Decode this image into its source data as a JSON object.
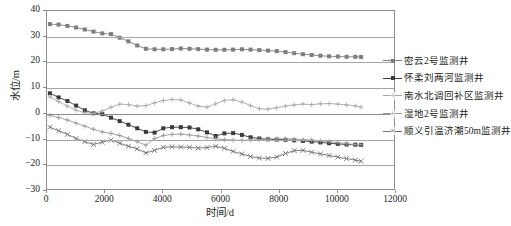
{
  "chart_data": {
    "type": "line",
    "title": "",
    "xlabel": "时间/d",
    "ylabel": "水位/m",
    "xlim": [
      0,
      12000
    ],
    "ylim": [
      -30,
      40
    ],
    "xticks": [
      0,
      2000,
      4000,
      6000,
      8000,
      10000,
      12000
    ],
    "yticks": [
      -30,
      -20,
      -10,
      0,
      10,
      20,
      30,
      40
    ],
    "grid": true,
    "legend_position": "right",
    "series": [
      {
        "name": "密云2号监测井",
        "color": "#7d7d7d",
        "marker": "square",
        "x": [
          100,
          400,
          700,
          1000,
          1300,
          1600,
          1900,
          2200,
          2500,
          2800,
          3100,
          3400,
          3700,
          4000,
          4300,
          4600,
          4900,
          5200,
          5500,
          5800,
          6100,
          6400,
          6700,
          7000,
          7300,
          7600,
          7900,
          8200,
          8500,
          8800,
          9100,
          9400,
          9700,
          10000,
          10300,
          10600,
          10800
        ],
        "y": [
          34.9,
          34.7,
          34.2,
          33.6,
          32.8,
          32.0,
          31.3,
          31.0,
          29.6,
          28.2,
          26.6,
          25.3,
          25.1,
          25.1,
          25.2,
          25.4,
          25.3,
          25.2,
          25.0,
          24.9,
          24.9,
          25.0,
          25.1,
          25.0,
          24.8,
          24.6,
          24.4,
          24.0,
          23.6,
          23.2,
          22.9,
          22.6,
          22.4,
          22.3,
          22.2,
          22.2,
          22.1
        ]
      },
      {
        "name": "怀柔刘两河监测井",
        "color": "#3a3a3a",
        "marker": "square",
        "x": [
          100,
          400,
          700,
          1000,
          1300,
          1600,
          1900,
          2200,
          2500,
          2800,
          3100,
          3400,
          3700,
          4000,
          4300,
          4600,
          4900,
          5200,
          5500,
          5800,
          6100,
          6400,
          6700,
          7000,
          7300,
          7600,
          7900,
          8200,
          8500,
          8800,
          9100,
          9400,
          9700,
          10000,
          10300,
          10600,
          10800
        ],
        "y": [
          8.0,
          6.4,
          5.0,
          3.2,
          1.4,
          0.2,
          -0.1,
          -1.5,
          -2.8,
          -4.2,
          -5.6,
          -7.0,
          -7.3,
          -5.6,
          -5.2,
          -5.2,
          -5.3,
          -6.0,
          -7.2,
          -8.6,
          -7.6,
          -7.5,
          -8.2,
          -9.1,
          -9.6,
          -9.9,
          -10.0,
          -10.1,
          -10.3,
          -10.5,
          -10.8,
          -11.1,
          -11.4,
          -11.7,
          -11.9,
          -12.0,
          -12.1
        ]
      },
      {
        "name": "南水北调回补区监测井",
        "color": "#a8a8a8",
        "marker": "plus",
        "x": [
          100,
          400,
          700,
          1000,
          1300,
          1600,
          1900,
          2200,
          2500,
          2800,
          3100,
          3400,
          3700,
          4000,
          4300,
          4600,
          4900,
          5200,
          5500,
          5800,
          6100,
          6400,
          6700,
          7000,
          7300,
          7600,
          7900,
          8200,
          8500,
          8800,
          9100,
          9400,
          9700,
          10000,
          10300,
          10600,
          10800
        ],
        "y": [
          6.6,
          4.8,
          3.0,
          1.4,
          0.4,
          0.2,
          1.1,
          2.6,
          3.8,
          3.6,
          3.0,
          3.2,
          4.3,
          5.2,
          5.6,
          5.4,
          4.2,
          3.0,
          2.6,
          3.9,
          5.2,
          5.5,
          4.6,
          3.2,
          2.0,
          1.8,
          2.4,
          3.0,
          3.5,
          3.8,
          3.6,
          3.9,
          4.0,
          3.8,
          3.5,
          3.1,
          2.6
        ]
      },
      {
        "name": "湿地2号监测井",
        "color": "#9a9a9a",
        "marker": "plus",
        "x": [
          100,
          400,
          700,
          1000,
          1300,
          1600,
          1900,
          2200,
          2500,
          2800,
          3100,
          3400,
          3700,
          4000,
          4300,
          4600,
          4900,
          5200,
          5500,
          5800,
          6100,
          6400,
          6700,
          7000,
          7300,
          7600,
          7900,
          8200,
          8500,
          8800,
          9100,
          9400,
          9700,
          10000,
          10300,
          10600,
          10800
        ],
        "y": [
          -0.6,
          -1.4,
          -2.4,
          -3.6,
          -4.8,
          -6.0,
          -7.0,
          -7.6,
          -8.4,
          -9.6,
          -10.8,
          -12.2,
          -9.6,
          -8.4,
          -8.0,
          -7.9,
          -8.2,
          -8.6,
          -9.2,
          -9.7,
          -10.0,
          -10.2,
          -10.3,
          -10.2,
          -10.0,
          -9.8,
          -9.7,
          -9.7,
          -9.8,
          -10.0,
          -10.2,
          -10.5,
          -10.8,
          -11.2,
          -11.6,
          -11.9,
          -12.0
        ]
      },
      {
        "name": "顺义引温济潮50m监测井",
        "color": "#6f6f6f",
        "marker": "x",
        "x": [
          100,
          400,
          700,
          1000,
          1300,
          1600,
          1900,
          2200,
          2500,
          2800,
          3100,
          3400,
          3700,
          4000,
          4300,
          4600,
          4900,
          5200,
          5500,
          5800,
          6100,
          6400,
          6700,
          7000,
          7300,
          7600,
          7900,
          8200,
          8500,
          8800,
          9100,
          9400,
          9700,
          10000,
          10300,
          10600,
          10800
        ],
        "y": [
          -5.2,
          -6.6,
          -8.0,
          -9.6,
          -10.8,
          -11.9,
          -11.0,
          -10.2,
          -11.4,
          -12.6,
          -13.6,
          -15.2,
          -14.2,
          -13.0,
          -12.8,
          -12.9,
          -13.0,
          -13.3,
          -13.1,
          -12.6,
          -13.4,
          -14.6,
          -15.6,
          -16.6,
          -17.2,
          -17.3,
          -16.8,
          -15.4,
          -14.3,
          -14.2,
          -14.9,
          -15.6,
          -16.2,
          -16.8,
          -17.4,
          -18.0,
          -18.4
        ]
      }
    ]
  }
}
